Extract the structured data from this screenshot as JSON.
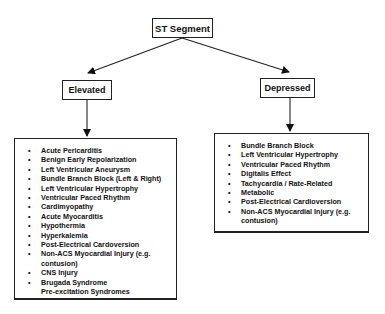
{
  "root": {
    "label": "ST Segment"
  },
  "branches": [
    {
      "label": "Elevated",
      "items": [
        {
          "text": "Acute Pericarditis",
          "bullet": true
        },
        {
          "text": "Benign Early Repolarization",
          "bullet": true
        },
        {
          "text": "Left Ventricular Aneurysm",
          "bullet": true
        },
        {
          "text": "Bundle Branch Block (Left & Right)",
          "bullet": true
        },
        {
          "text": "Left Ventricular Hypertrophy",
          "bullet": true
        },
        {
          "text": "Ventricular Paced Rhythm",
          "bullet": true
        },
        {
          "text": "Cardimyopathy",
          "bullet": true
        },
        {
          "text": "Acute Myocarditis",
          "bullet": true
        },
        {
          "text": "Hypothermia",
          "bullet": true
        },
        {
          "text": "Hyperkalemia",
          "bullet": true
        },
        {
          "text": "Post-Electrical Cardoversion",
          "bullet": true
        },
        {
          "text": "Non-ACS Myocardial Injury (e.g. contusion)",
          "bullet": true
        },
        {
          "text": "CNS Injury",
          "bullet": true
        },
        {
          "text": "Brugada Syndrome",
          "bullet": true
        },
        {
          "text": "Pre-excitation Syndromes",
          "bullet": false
        }
      ]
    },
    {
      "label": "Depressed",
      "items": [
        {
          "text": "Bundle Branch Block",
          "bullet": true
        },
        {
          "text": "Left Ventricular Hypertrophy",
          "bullet": true
        },
        {
          "text": "Ventricular Paced Rhythm",
          "bullet": true
        },
        {
          "text": "Digitalis Effect",
          "bullet": true
        },
        {
          "text": "Tachycardia / Rate-Related",
          "bullet": true
        },
        {
          "text": "Metabolic",
          "bullet": true
        },
        {
          "text": "Post-Electrical Cardioversion",
          "bullet": true
        },
        {
          "text": "Non-ACS Myocardial Injury (e.g. contusion)",
          "bullet": true
        }
      ]
    }
  ],
  "bullet_glyph": "•"
}
